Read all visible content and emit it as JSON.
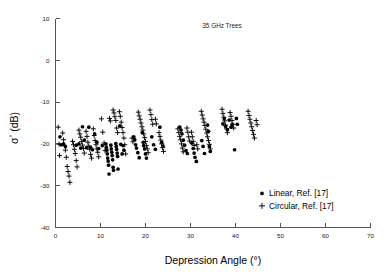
{
  "chart_data": {
    "type": "scatter",
    "title": "35 GHz Trees",
    "xlabel": "Depression Angle (°)",
    "ylabel": "σ° (dB)",
    "xlim": [
      0,
      70
    ],
    "ylim": [
      -40,
      10
    ],
    "xticks": [
      0,
      10,
      20,
      30,
      40,
      50,
      60,
      70
    ],
    "yticks": [
      10,
      0,
      -10,
      -20,
      -30,
      -40
    ],
    "xtick_labels": [
      "0",
      "10",
      "20",
      "30",
      "40",
      "50",
      "60",
      "70"
    ],
    "ytick_labels": [
      "10",
      "0",
      "-10",
      "-20",
      "-30",
      "-40"
    ],
    "grid": false,
    "legend_position": "lower right",
    "series": [
      {
        "name": "Linear, Ref. [17]",
        "marker": "dot",
        "color": "#000000",
        "points": [
          [
            1.0,
            -18.3
          ],
          [
            1.3,
            -20.2
          ],
          [
            1.8,
            -20.0
          ],
          [
            2.2,
            -20.6
          ],
          [
            4.6,
            -20.3
          ],
          [
            5.2,
            -20.0
          ],
          [
            5.6,
            -21.0
          ],
          [
            6.0,
            -15.9
          ],
          [
            6.4,
            -19.1
          ],
          [
            6.9,
            -20.9
          ],
          [
            7.4,
            -16.0
          ],
          [
            7.8,
            -20.8
          ],
          [
            8.2,
            -21.4
          ],
          [
            8.7,
            -17.6
          ],
          [
            9.2,
            -19.6
          ],
          [
            9.6,
            -21.1
          ],
          [
            10.4,
            -20.4
          ],
          [
            11.2,
            -20.0
          ],
          [
            11.3,
            -20.8
          ],
          [
            11.4,
            -21.5
          ],
          [
            11.5,
            -22.4
          ],
          [
            11.6,
            -23.4
          ],
          [
            11.7,
            -24.1
          ],
          [
            11.8,
            -25.1
          ],
          [
            11.9,
            -27.2
          ],
          [
            12.3,
            -20.3
          ],
          [
            12.4,
            -21.2
          ],
          [
            12.5,
            -22.0
          ],
          [
            12.6,
            -22.8
          ],
          [
            12.7,
            -23.8
          ],
          [
            12.8,
            -25.6
          ],
          [
            12.9,
            -26.3
          ],
          [
            13.4,
            -19.9
          ],
          [
            13.5,
            -20.6
          ],
          [
            13.6,
            -21.3
          ],
          [
            13.7,
            -22.2
          ],
          [
            13.8,
            -23.0
          ],
          [
            13.9,
            -26.0
          ],
          [
            14.3,
            -15.7
          ],
          [
            14.5,
            -20.1
          ],
          [
            14.8,
            -22.4
          ],
          [
            15.0,
            -20.4
          ],
          [
            15.2,
            -21.5
          ],
          [
            17.4,
            -18.3
          ],
          [
            17.6,
            -19.0
          ],
          [
            17.8,
            -20.2
          ],
          [
            18.0,
            -21.0
          ],
          [
            18.3,
            -22.1
          ],
          [
            18.6,
            -23.3
          ],
          [
            19.3,
            -17.3
          ],
          [
            19.5,
            -19.6
          ],
          [
            19.6,
            -20.4
          ],
          [
            19.8,
            -21.2
          ],
          [
            20.0,
            -22.4
          ],
          [
            20.2,
            -23.4
          ],
          [
            21.4,
            -18.3
          ],
          [
            21.8,
            -20.2
          ],
          [
            22.2,
            -21.3
          ],
          [
            23.2,
            -16.0
          ],
          [
            23.6,
            -19.6
          ],
          [
            23.9,
            -20.5
          ],
          [
            27.6,
            -16.0
          ],
          [
            27.9,
            -16.7
          ],
          [
            28.1,
            -17.6
          ],
          [
            28.4,
            -19.1
          ],
          [
            28.7,
            -20.3
          ],
          [
            29.0,
            -21.6
          ],
          [
            29.3,
            -22.3
          ],
          [
            30.3,
            -19.8
          ],
          [
            30.6,
            -21.1
          ],
          [
            30.8,
            -22.2
          ],
          [
            31.0,
            -23.2
          ],
          [
            31.3,
            -24.2
          ],
          [
            32.5,
            -19.2
          ],
          [
            32.8,
            -20.6
          ],
          [
            33.1,
            -22.3
          ],
          [
            33.8,
            -15.5
          ],
          [
            34.0,
            -17.0
          ],
          [
            34.2,
            -20.6
          ],
          [
            34.4,
            -21.8
          ],
          [
            37.2,
            -15.2
          ],
          [
            37.5,
            -14.0
          ],
          [
            37.8,
            -15.8
          ],
          [
            38.2,
            -16.6
          ],
          [
            38.6,
            -14.3
          ],
          [
            39.0,
            -16.0
          ],
          [
            39.3,
            -15.4
          ],
          [
            39.8,
            -21.4
          ],
          [
            40.2,
            -13.9
          ],
          [
            40.4,
            -15.3
          ]
        ]
      },
      {
        "name": "Circular, Ref. [17]",
        "marker": "plus",
        "color": "#000000",
        "points": [
          [
            0.6,
            -16.0
          ],
          [
            0.8,
            -20.1
          ],
          [
            0.9,
            -22.8
          ],
          [
            1.6,
            -17.4
          ],
          [
            1.8,
            -19.0
          ],
          [
            2.0,
            -20.4
          ],
          [
            2.2,
            -21.5
          ],
          [
            2.4,
            -23.2
          ],
          [
            2.6,
            -25.4
          ],
          [
            2.8,
            -26.6
          ],
          [
            3.0,
            -27.7
          ],
          [
            3.2,
            -29.2
          ],
          [
            3.8,
            -19.4
          ],
          [
            4.0,
            -20.2
          ],
          [
            4.2,
            -21.3
          ],
          [
            4.4,
            -22.3
          ],
          [
            4.6,
            -24.0
          ],
          [
            4.8,
            -25.5
          ],
          [
            5.2,
            -16.7
          ],
          [
            5.4,
            -17.6
          ],
          [
            5.6,
            -18.4
          ],
          [
            5.8,
            -19.4
          ],
          [
            6.0,
            -20.3
          ],
          [
            6.2,
            -21.1
          ],
          [
            6.4,
            -22.2
          ],
          [
            6.8,
            -17.0
          ],
          [
            7.0,
            -18.2
          ],
          [
            7.2,
            -19.6
          ],
          [
            7.4,
            -20.5
          ],
          [
            7.6,
            -21.3
          ],
          [
            7.8,
            -22.5
          ],
          [
            8.0,
            -23.4
          ],
          [
            8.4,
            -16.4
          ],
          [
            8.6,
            -18.0
          ],
          [
            8.8,
            -19.2
          ],
          [
            9.0,
            -20.2
          ],
          [
            9.2,
            -21.2
          ],
          [
            9.4,
            -22.0
          ],
          [
            9.6,
            -23.1
          ],
          [
            10.2,
            -14.0
          ],
          [
            10.5,
            -17.2
          ],
          [
            10.8,
            -19.8
          ],
          [
            11.0,
            -21.6
          ],
          [
            12.0,
            -13.9
          ],
          [
            12.2,
            -14.5
          ],
          [
            12.8,
            -11.9
          ],
          [
            13.0,
            -12.6
          ],
          [
            13.2,
            -13.5
          ],
          [
            13.4,
            -14.4
          ],
          [
            13.6,
            -16.2
          ],
          [
            13.8,
            -17.3
          ],
          [
            14.2,
            -12.3
          ],
          [
            14.4,
            -13.4
          ],
          [
            14.6,
            -14.8
          ],
          [
            14.8,
            -16.1
          ],
          [
            15.0,
            -17.3
          ],
          [
            15.2,
            -18.6
          ],
          [
            15.4,
            -20.2
          ],
          [
            15.6,
            -22.4
          ],
          [
            17.0,
            -18.6
          ],
          [
            17.2,
            -19.5
          ],
          [
            18.4,
            -12.4
          ],
          [
            18.6,
            -13.3
          ],
          [
            18.8,
            -14.1
          ],
          [
            19.0,
            -15.0
          ],
          [
            19.2,
            -15.9
          ],
          [
            19.4,
            -16.7
          ],
          [
            19.6,
            -17.6
          ],
          [
            19.8,
            -18.5
          ],
          [
            20.0,
            -19.4
          ],
          [
            20.2,
            -20.4
          ],
          [
            20.4,
            -21.2
          ],
          [
            20.6,
            -22.1
          ],
          [
            21.0,
            -11.9
          ],
          [
            21.2,
            -13.0
          ],
          [
            21.4,
            -14.2
          ],
          [
            21.6,
            -15.3
          ],
          [
            22.2,
            -14.1
          ],
          [
            22.4,
            -15.2
          ],
          [
            23.0,
            -17.3
          ],
          [
            23.2,
            -18.2
          ],
          [
            23.4,
            -19.1
          ],
          [
            23.6,
            -20.0
          ],
          [
            23.8,
            -20.9
          ],
          [
            24.0,
            -21.8
          ],
          [
            27.2,
            -16.4
          ],
          [
            27.4,
            -17.3
          ],
          [
            27.6,
            -18.2
          ],
          [
            27.8,
            -19.0
          ],
          [
            28.0,
            -20.0
          ],
          [
            28.2,
            -21.0
          ],
          [
            28.4,
            -21.9
          ],
          [
            29.2,
            -16.2
          ],
          [
            29.4,
            -17.2
          ],
          [
            29.6,
            -18.3
          ],
          [
            29.8,
            -19.3
          ],
          [
            30.2,
            -17.2
          ],
          [
            30.4,
            -18.3
          ],
          [
            30.6,
            -19.4
          ],
          [
            30.8,
            -20.4
          ],
          [
            31.4,
            -20.2
          ],
          [
            31.6,
            -21.2
          ],
          [
            32.4,
            -12.2
          ],
          [
            32.6,
            -13.1
          ],
          [
            32.8,
            -14.0
          ],
          [
            33.0,
            -14.8
          ],
          [
            33.2,
            -15.6
          ],
          [
            33.4,
            -16.5
          ],
          [
            33.6,
            -17.4
          ],
          [
            33.8,
            -18.3
          ],
          [
            34.0,
            -19.2
          ],
          [
            34.2,
            -20.1
          ],
          [
            34.4,
            -21.2
          ],
          [
            37.0,
            -11.7
          ],
          [
            37.2,
            -12.7
          ],
          [
            37.4,
            -13.6
          ],
          [
            37.6,
            -14.5
          ],
          [
            37.8,
            -15.5
          ],
          [
            38.0,
            -16.4
          ],
          [
            38.2,
            -17.3
          ],
          [
            38.8,
            -12.5
          ],
          [
            39.0,
            -13.4
          ],
          [
            39.2,
            -14.4
          ],
          [
            39.4,
            -15.3
          ],
          [
            39.6,
            -16.2
          ],
          [
            42.8,
            -12.2
          ],
          [
            43.0,
            -13.2
          ],
          [
            43.2,
            -14.1
          ],
          [
            43.4,
            -15.0
          ],
          [
            43.6,
            -15.9
          ],
          [
            43.8,
            -16.8
          ],
          [
            44.0,
            -17.7
          ],
          [
            44.2,
            -18.6
          ],
          [
            44.6,
            -14.4
          ],
          [
            44.8,
            -15.4
          ]
        ]
      }
    ]
  },
  "legend": {
    "entries": [
      {
        "label": "Linear, Ref. [17]",
        "marker": "dot"
      },
      {
        "label": "Circular, Ref. [17]",
        "marker": "plus"
      }
    ]
  }
}
